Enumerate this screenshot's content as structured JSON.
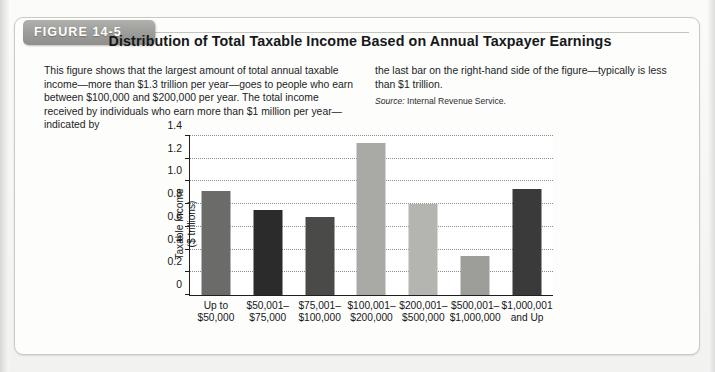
{
  "figure": {
    "tab_label": "FIGURE 14-5",
    "title": "Distribution of Total Taxable Income Based on Annual Taxpayer Earnings",
    "caption_left": "This figure shows that the largest amount of total annual taxable income—more than $1.3 trillion per year—goes to people who earn between $100,000 and $200,000 per year. The total income received by individuals who earn more than $1 million per year—indicated by",
    "caption_right": "the last bar on the right-hand side of the figure—typically is less than $1 trillion.",
    "source_word": "Source:",
    "source_text": " Internal Revenue Service."
  },
  "chart_data": {
    "type": "bar",
    "title": "Distribution of Total Taxable Income Based on Annual Taxpayer Earnings",
    "xlabel": "",
    "ylabel": "Taxable Income ($ trillions)",
    "ylabel_line1": "Taxable Income",
    "ylabel_line2": "($ trillions)",
    "ylim": [
      0,
      1.4
    ],
    "ytick_values": [
      0,
      0.2,
      0.4,
      0.6,
      0.8,
      1.0,
      1.2,
      1.4
    ],
    "ytick_labels": [
      "0",
      "0.2",
      "0.4",
      "0.6",
      "0.8",
      "1.0",
      "1.2",
      "1.4"
    ],
    "grid": true,
    "legend": "none",
    "categories": [
      "Up to\n$50,000",
      "$50,001–\n$75,000",
      "$75,001–\n$100,000",
      "$100,001–\n$200,000",
      "$200,001–\n$500,000",
      "$500,001–\n$1,000,000",
      "$1,000,001\nand Up"
    ],
    "category_lines": [
      [
        "Up to",
        "$50,000"
      ],
      [
        "$50,001–",
        "$75,000"
      ],
      [
        "$75,001–",
        "$100,000"
      ],
      [
        "$100,001–",
        "$200,000"
      ],
      [
        "$200,001–",
        "$500,000"
      ],
      [
        "$500,001–",
        "$1,000,000"
      ],
      [
        "$1,000,001",
        "and Up"
      ]
    ],
    "values": [
      0.92,
      0.75,
      0.69,
      1.34,
      0.8,
      0.34,
      0.93
    ],
    "bar_colors": [
      "#6b6b69",
      "#2b2b2b",
      "#4a4a49",
      "#a9a9a6",
      "#b4b4b1",
      "#9d9d9a",
      "#3a3a3a"
    ]
  },
  "colors": {
    "page_background": "#f7f7f6",
    "card_background": "#fdfdfc",
    "tab_background": "#9b9b98",
    "axis": "#1d1f21",
    "gridline": "#8d8d8a",
    "text": "#16181a"
  }
}
